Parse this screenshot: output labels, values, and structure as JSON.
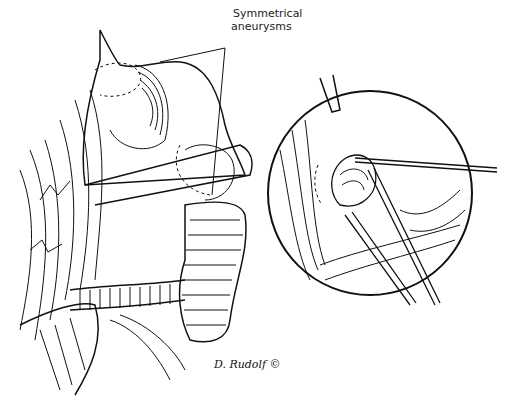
{
  "figure": {
    "type": "surgical line illustration",
    "callout": {
      "line1": "Symmetrical",
      "line2": "aneurysms"
    },
    "signature": "D. Rudolf ©",
    "colors": {
      "ink": "#111111",
      "background": "#ffffff"
    },
    "panels": [
      {
        "name": "main-view",
        "description": "dissected vessels with two aneurysms, dashed outlines"
      },
      {
        "name": "inset-circle",
        "description": "magnified view with suction tip and forceps/clip applier"
      }
    ]
  }
}
